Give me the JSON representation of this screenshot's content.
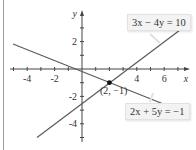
{
  "diagram": {
    "type": "coordinate-plane-system-of-equations",
    "axes": {
      "x_label": "x",
      "y_label": "y",
      "x_ticks": [
        "-4",
        "-2",
        "4",
        "6"
      ],
      "y_ticks": [
        "2",
        "-2",
        "-4"
      ],
      "x_range": [
        -5.8,
        8.2
      ],
      "y_range": [
        -5.5,
        5.2
      ]
    },
    "lines": [
      {
        "equation": "3x − 4y = 10",
        "color": "#555555"
      },
      {
        "equation": "2x + 5y = −1",
        "color": "#555555"
      }
    ],
    "intersection": {
      "label": "(2, −1)",
      "x": 2,
      "y": -1
    },
    "colors": {
      "axis": "#444444",
      "line": "#5a5a5a",
      "label_box": "#f3f3f3",
      "point": "#111111"
    }
  }
}
